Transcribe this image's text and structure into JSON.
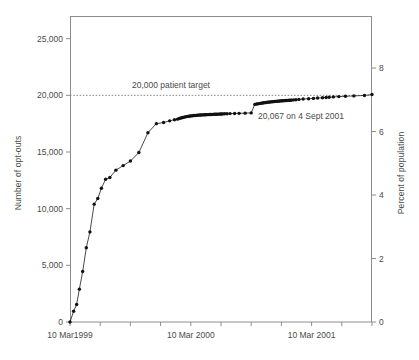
{
  "chart_data": {
    "type": "line",
    "title": "",
    "xlabel": "",
    "ylabel": "Number of opt-outs",
    "y2label": "Percent of population",
    "ylim": [
      0,
      27000
    ],
    "y2lim": [
      0,
      9.64
    ],
    "xlim": [
      0,
      1000
    ],
    "grid": false,
    "legend": null,
    "yticks": [
      0,
      5000,
      10000,
      15000,
      20000,
      25000
    ],
    "ytick_labels": [
      "0",
      "5,000",
      "10,000",
      "15,000",
      "20,000",
      "25,000"
    ],
    "y2ticks": [
      0,
      2,
      4,
      6,
      8
    ],
    "y2tick_labels": [
      "0",
      "2",
      "4",
      "6",
      "8"
    ],
    "xticks": [
      0,
      100,
      200,
      300,
      400,
      500,
      600,
      700,
      800,
      900,
      1000
    ],
    "xtick_labels": [
      "10 Mar1999",
      "",
      "",
      "",
      "10 Mar 2000",
      "",
      "",
      "",
      "10 Mar 2001",
      "",
      ""
    ],
    "xtick_label_positions": [
      0,
      400,
      800
    ],
    "annotations": [
      {
        "name": "target-line-label",
        "text": "20,000 patient target",
        "x": 132,
        "y": 88
      },
      {
        "name": "final-value-label",
        "text": "20,067 on 4 Sept 2001",
        "x": 258,
        "y": 119
      }
    ],
    "target_line": {
      "value": 20000,
      "label": "20,000 patient target",
      "style": "dashed"
    },
    "series": [
      {
        "name": "Cumulative opt-outs",
        "x": [
          0,
          12,
          22,
          31,
          42,
          54,
          66,
          80,
          92,
          104,
          118,
          132,
          152,
          176,
          200,
          228,
          258,
          286,
          310,
          330,
          346,
          356,
          362,
          366,
          370,
          374,
          378,
          382,
          386,
          390,
          394,
          398,
          402,
          406,
          410,
          414,
          418,
          422,
          426,
          430,
          434,
          438,
          442,
          446,
          450,
          454,
          458,
          462,
          466,
          470,
          474,
          478,
          482,
          486,
          490,
          494,
          498,
          502,
          506,
          512,
          520,
          530,
          545,
          560,
          580,
          600,
          612,
          618,
          622,
          626,
          630,
          634,
          638,
          642,
          646,
          650,
          654,
          658,
          662,
          666,
          670,
          674,
          678,
          682,
          686,
          690,
          694,
          698,
          702,
          706,
          710,
          714,
          718,
          722,
          726,
          730,
          734,
          740,
          748,
          758,
          772,
          790,
          806,
          820,
          836,
          848,
          858,
          872,
          890,
          912,
          940,
          975,
          1000
        ],
        "y": [
          0,
          950,
          1550,
          2900,
          4450,
          6550,
          7950,
          10400,
          10900,
          11800,
          12600,
          12750,
          13400,
          13800,
          14200,
          14950,
          16700,
          17500,
          17600,
          17750,
          17850,
          17900,
          17950,
          17990,
          18020,
          18050,
          18080,
          18100,
          18120,
          18140,
          18160,
          18175,
          18190,
          18205,
          18215,
          18225,
          18235,
          18245,
          18255,
          18262,
          18268,
          18274,
          18280,
          18285,
          18290,
          18295,
          18300,
          18305,
          18310,
          18315,
          18320,
          18325,
          18330,
          18335,
          18340,
          18345,
          18350,
          18355,
          18360,
          18370,
          18380,
          18390,
          18400,
          18410,
          18430,
          18450,
          19200,
          19230,
          19250,
          19270,
          19290,
          19310,
          19325,
          19340,
          19355,
          19370,
          19385,
          19400,
          19412,
          19424,
          19436,
          19448,
          19458,
          19468,
          19478,
          19488,
          19498,
          19508,
          19516,
          19524,
          19532,
          19540,
          19548,
          19556,
          19564,
          19572,
          19580,
          19595,
          19615,
          19640,
          19670,
          19700,
          19730,
          19760,
          19790,
          19810,
          19830,
          19860,
          19890,
          19920,
          19950,
          19990,
          20067
        ]
      }
    ],
    "final_point": {
      "value": 20067,
      "label": "20,067 on 4 Sept 2001"
    }
  },
  "figure": {
    "plot_area": {
      "left": 70,
      "top": 16,
      "right": 372,
      "bottom": 322
    },
    "colors": {
      "line": "#111111",
      "marker": "#111111",
      "axis": "#8d8d8d",
      "text": "#4a4a4a",
      "background": "#ffffff"
    }
  },
  "caption": {
    "text": ""
  }
}
